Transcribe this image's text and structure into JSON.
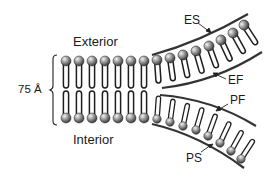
{
  "diagram": {
    "labels": {
      "exterior": "Exterior",
      "interior": "Interior",
      "thickness": "75 Å",
      "es": "ES",
      "ef": "EF",
      "pf": "PF",
      "ps": "PS"
    },
    "colors": {
      "line": "#222222",
      "head_light": "#d9d9d9",
      "head_dark": "#3a3a3a",
      "background": "#ffffff"
    },
    "structure": {
      "flat_lipid_pairs": 8,
      "upper_curved_lipids": 8,
      "lower_curved_lipids": 8
    }
  }
}
